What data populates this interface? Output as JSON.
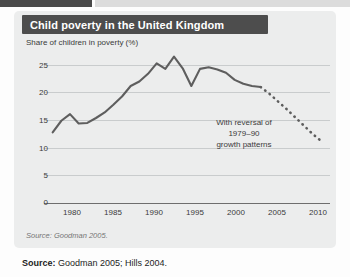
{
  "figure": {
    "title": "Child poverty in the United Kingdom",
    "subtitle": "Share of children in poverty (%)",
    "figure_source": "Source: Goodman 2005.",
    "annotation_lines": [
      "With reversal of",
      "1979–90",
      "growth patterns"
    ],
    "colors": {
      "title_band": "#4d4d4d",
      "panel_background": "#eceded",
      "line": "#5e5e5e",
      "gridline": "#c9cccd",
      "axis": "#6e6e6e",
      "text": "#3b3b3b"
    }
  },
  "page_source": {
    "label": "Source:",
    "text": " Goodman 2005; Hills 2004."
  },
  "chart_data": {
    "type": "line",
    "title": "Child poverty in the United Kingdom",
    "subtitle": "Share of children in poverty (%)",
    "xlabel": "",
    "ylabel": "Share of children in poverty (%)",
    "xlim": [
      1978,
      2011
    ],
    "ylim": [
      0,
      27
    ],
    "xticks": [
      1980,
      1985,
      1990,
      1995,
      2000,
      2005,
      2010
    ],
    "yticks": [
      0,
      5,
      10,
      15,
      20,
      25
    ],
    "grid": true,
    "legend": false,
    "annotations": [
      {
        "text": "With reversal of 1979–90 growth patterns",
        "x": 2002,
        "y": 15,
        "refers_to": "projected-series"
      }
    ],
    "series": [
      {
        "name": "Child poverty rate (actual)",
        "style": "solid",
        "x": [
          1979,
          1980,
          1981,
          1982,
          1983,
          1984,
          1985,
          1986,
          1987,
          1988,
          1989,
          1990,
          1991,
          1992,
          1993,
          1994,
          1995,
          1996,
          1997,
          1998,
          1999,
          2000,
          2001,
          2002,
          2003
        ],
        "y": [
          12.8,
          14.9,
          16.1,
          14.4,
          14.5,
          15.4,
          16.4,
          17.8,
          19.3,
          21.2,
          22.0,
          23.4,
          25.3,
          24.3,
          26.5,
          24.4,
          21.2,
          24.3,
          24.6,
          24.2,
          23.6,
          22.3,
          21.6,
          21.2,
          21.0
        ]
      },
      {
        "name": "With reversal of 1979–90 growth patterns (projection)",
        "style": "dotted",
        "x": [
          2003,
          2004,
          2005,
          2006,
          2007,
          2008,
          2009,
          2010
        ],
        "y": [
          21.0,
          19.8,
          18.4,
          17.0,
          15.5,
          14.0,
          12.5,
          11.2
        ]
      }
    ]
  }
}
